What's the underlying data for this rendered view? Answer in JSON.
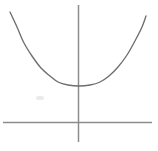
{
  "figure": {
    "background_color": "#ffffff",
    "width": 158,
    "height": 151
  },
  "axes": {
    "x_axis": {
      "label": "horizontal axis",
      "color": "#8c8c8c",
      "x_start": 3,
      "x_end": 152,
      "y": 122.5,
      "stroke_width": 1.5
    },
    "y_axis": {
      "label": "vertical axis",
      "color": "#8c8c8c",
      "x": 78.5,
      "y_start": 5,
      "y_end": 142,
      "stroke_width": 1.5
    },
    "origin": {
      "x": 78.5,
      "y": 122.5
    }
  },
  "chart_data": {
    "type": "line",
    "xlabel": "",
    "ylabel": "",
    "grid": false,
    "legend": null,
    "axis_origin_px": {
      "x": 78.5,
      "y": 122.5
    },
    "vertex_px": {
      "x": 79,
      "y": 86
    },
    "curve_color": "#6e6e6e",
    "curve_stroke_width": 1.35,
    "endpoints_px": {
      "left": {
        "x": 10,
        "y": 12
      },
      "right": {
        "x": 146,
        "y": 16
      }
    },
    "points_px": [
      {
        "x": 10,
        "y": 12
      },
      {
        "x": 17,
        "y": 27
      },
      {
        "x": 24,
        "y": 43
      },
      {
        "x": 32,
        "y": 56
      },
      {
        "x": 41,
        "y": 68
      },
      {
        "x": 50,
        "y": 76
      },
      {
        "x": 58,
        "y": 82
      },
      {
        "x": 68,
        "y": 85
      },
      {
        "x": 79,
        "y": 86
      },
      {
        "x": 90,
        "y": 85
      },
      {
        "x": 100,
        "y": 82
      },
      {
        "x": 109,
        "y": 76
      },
      {
        "x": 118,
        "y": 67
      },
      {
        "x": 127,
        "y": 55
      },
      {
        "x": 136,
        "y": 39
      },
      {
        "x": 142,
        "y": 27
      },
      {
        "x": 146,
        "y": 16
      }
    ]
  },
  "artifacts": {
    "smudge": {
      "label": "faint scan smudge",
      "x": 40,
      "y": 98,
      "rx": 4,
      "ry": 2.2,
      "color": "#d8d8d8"
    }
  }
}
